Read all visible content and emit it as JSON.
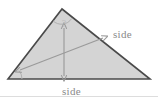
{
  "figure": {
    "type": "geometry-diagram",
    "shape": "triangle",
    "title": "",
    "background_color": "#ffffff",
    "triangle": {
      "fill_color": "#d4d4d4",
      "stroke_color": "#4a4a4a",
      "stroke_width": 1.6,
      "vertices": {
        "apex": {
          "x": 62,
          "y": 9
        },
        "bottom_left": {
          "x": 8,
          "y": 79
        },
        "bottom_right": {
          "x": 150,
          "y": 79
        }
      }
    },
    "labels": {
      "right_side": "side",
      "bottom_side": "side",
      "apex_marker": "?"
    },
    "label_color": "#8a8a8a",
    "marker_color": "#bdbdbd",
    "arrows": {
      "color": "#9a9a9a",
      "vertical": {
        "name": "height-arrow",
        "from": {
          "x": 64,
          "y": 28
        },
        "to": {
          "x": 64,
          "y": 76
        },
        "double_headed": true
      },
      "diagonal": {
        "name": "slant-arrow",
        "from": {
          "x": 20,
          "y": 70
        },
        "to": {
          "x": 103,
          "y": 38
        },
        "double_headed": true
      }
    },
    "angle_arcs": {
      "color": "#b0b0b0",
      "apex_arc": {
        "cx": 62,
        "cy": 9,
        "r": 12
      },
      "bottom_left_arc": {
        "cx": 8,
        "cy": 79,
        "r": 14
      }
    },
    "bottom_rule": {
      "color": "#dddddd",
      "y": 96
    }
  }
}
